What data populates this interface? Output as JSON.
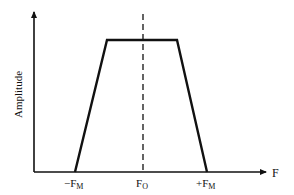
{
  "diagram": {
    "type": "trapezoidal-spectrum",
    "y_axis_label": "Amplitude",
    "x_axis_label": "F",
    "ticks": [
      {
        "base": "−F",
        "sub": "M",
        "x": 75
      },
      {
        "base": "F",
        "sub": "O",
        "x": 143
      },
      {
        "base": "+F",
        "sub": "M",
        "x": 207
      }
    ],
    "shape": {
      "points": [
        [
          75,
          172
        ],
        [
          107,
          40
        ],
        [
          177,
          40
        ],
        [
          207,
          172
        ]
      ],
      "description": "Trapezoid spectrum centered on F_O, flat top, sloping sides down to -F_M and +F_M"
    },
    "center_line": {
      "x": 143,
      "style": "dashed"
    },
    "colors": {
      "line": "#111111",
      "background": "#ffffff"
    }
  }
}
